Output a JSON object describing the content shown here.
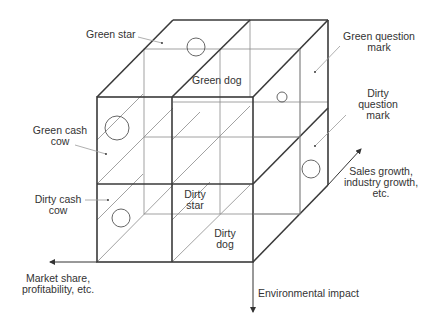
{
  "diagram": {
    "type": "3D cube matrix (environmental BCG portfolio)",
    "cells": {
      "green_star": "Green star",
      "green_dog": "Green dog",
      "green_question_mark_line1": "Green question",
      "green_question_mark_line2": "mark",
      "dirty_question_mark_line1": "Dirty",
      "dirty_question_mark_line2": "question",
      "dirty_question_mark_line3": "mark",
      "green_cash_cow_line1": "Green cash",
      "green_cash_cow_line2": "cow",
      "dirty_cash_cow_line1": "Dirty cash",
      "dirty_cash_cow_line2": "cow",
      "dirty_star_line1": "Dirty",
      "dirty_star_line2": "star",
      "dirty_dog_line1": "Dirty",
      "dirty_dog_line2": "dog"
    },
    "axes": {
      "x_line1": "Market share,",
      "x_line2": "profitability, etc.",
      "depth_line1": "Sales growth,",
      "depth_line2": "industry growth,",
      "depth_line3": "etc.",
      "vertical": "Environmental impact"
    },
    "colors": {
      "edge": "#3a3a3a",
      "inner_line": "#8a8a8a",
      "text": "#333333"
    }
  }
}
